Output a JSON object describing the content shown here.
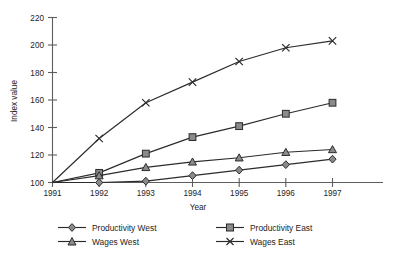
{
  "chart_data": {
    "type": "line",
    "title": "",
    "xlabel": "Year",
    "ylabel": "Index value",
    "categories": [
      "1991",
      "1992",
      "1993",
      "1994",
      "1995",
      "1996",
      "1997"
    ],
    "x": [
      1991,
      1992,
      1993,
      1994,
      1995,
      1996,
      1997
    ],
    "xlim": [
      1991,
      1997
    ],
    "ylim": [
      100,
      220
    ],
    "ytick_labels": [
      "100",
      "120",
      "140",
      "160",
      "180",
      "200",
      "220"
    ],
    "yticks": [
      100,
      120,
      140,
      160,
      180,
      200,
      220
    ],
    "grid": false,
    "legend_position": "bottom",
    "series": [
      {
        "name": "Productivity West",
        "marker": "diamond",
        "values": [
          100,
          100,
          101,
          105,
          109,
          113,
          117
        ]
      },
      {
        "name": "Productivity East",
        "marker": "square",
        "values": [
          100,
          107,
          121,
          133,
          141,
          150,
          158
        ]
      },
      {
        "name": "Wages West",
        "marker": "triangle",
        "values": [
          100,
          105,
          111,
          115,
          118,
          122,
          124
        ]
      },
      {
        "name": "Wages East",
        "marker": "cross-x",
        "values": [
          100,
          132,
          158,
          173,
          188,
          198,
          203
        ]
      }
    ]
  },
  "legend": {
    "entries": [
      {
        "label": "Productivity West",
        "marker": "diamond"
      },
      {
        "label": "Productivity East",
        "marker": "square"
      },
      {
        "label": "Wages West",
        "marker": "triangle"
      },
      {
        "label": "Wages East",
        "marker": "cross-x"
      }
    ]
  },
  "colors": {
    "line": "#2b2b2b",
    "marker_fill": "#8a8a8a",
    "axis": "#5d5d5d",
    "background": "#ffffff",
    "text": "#1d1d1d"
  }
}
